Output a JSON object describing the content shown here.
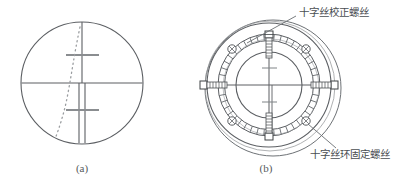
{
  "figure": {
    "background_color": "#ffffff",
    "line_color": "#5c5f63",
    "dark_line_color": "#3f4245",
    "text_color": "#4a4e52",
    "captions": {
      "left": "(a)",
      "right": "(b)"
    },
    "annotations": {
      "top_label": "十字丝校正螺丝",
      "bottom_label": "十字丝环固定螺丝"
    },
    "panel_a": {
      "name": "reticle-view",
      "circle": {
        "cx": 82,
        "cy": 83,
        "r": 60
      },
      "crosshair": {
        "vertical_x": 82,
        "horizontal_y": 83,
        "stadia_offsets": [
          -28,
          28
        ]
      },
      "dotted_curve_label": "alignment-trace"
    },
    "panel_b": {
      "name": "reticle-ring-assembly",
      "outer_circle": {
        "cx": 272,
        "cy": 86,
        "r": 70
      },
      "flange_circle": {
        "cx": 268,
        "cy": 84,
        "r": 62
      },
      "knurled_ring_outer": {
        "cx": 268,
        "cy": 84,
        "r": 50
      },
      "knurled_ring_inner": {
        "cx": 268,
        "cy": 84,
        "r": 44
      },
      "reticle_circle": {
        "cx": 268,
        "cy": 84,
        "r": 33
      },
      "adjust_screw_count": 4,
      "fixing_screw_count": 4
    }
  }
}
